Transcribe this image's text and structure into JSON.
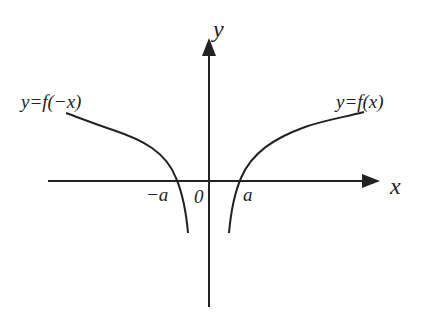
{
  "diagram": {
    "type": "function-graph",
    "colors": {
      "stroke": "#222222",
      "background": "#ffffff"
    },
    "axes": {
      "x_label": "x",
      "y_label": "y",
      "origin_label": "0"
    },
    "curves": [
      {
        "label": "y=f(−x)",
        "side": "left",
        "x_intercept_label": "−a"
      },
      {
        "label": "y=f(x)",
        "side": "right",
        "x_intercept_label": "a"
      }
    ]
  }
}
